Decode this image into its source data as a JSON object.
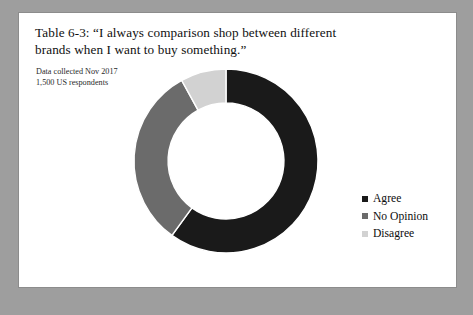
{
  "figure": {
    "title": "Table 6-3: “I always comparison shop between different brands when I want to buy something.”",
    "subtitle_line1": "Data collected Nov 2017",
    "subtitle_line2": "1,500 US respondents"
  },
  "colors": {
    "agree": "#1a1a1a",
    "no_opinion": "#6b6b6b",
    "disagree": "#d2d2d2",
    "page_background": "#ffffff",
    "backdrop": "#9e9e9e",
    "page_border": "#8c8c8c"
  },
  "legend": {
    "items": [
      {
        "label": "Agree",
        "color": "#1a1a1a"
      },
      {
        "label": "No Opinion",
        "color": "#6b6b6b"
      },
      {
        "label": "Disagree",
        "color": "#d2d2d2"
      }
    ]
  },
  "chart_data": {
    "type": "pie",
    "variant": "donut",
    "title": "Table 6-3: “I always comparison shop between different brands when I want to buy something.”",
    "subtitle": "Data collected Nov 2017 / 1,500 US respondents",
    "categories": [
      "Agree",
      "No Opinion",
      "Disagree"
    ],
    "values": [
      60,
      32,
      8
    ],
    "value_unit": "percent",
    "colors": [
      "#1a1a1a",
      "#6b6b6b",
      "#d2d2d2"
    ],
    "start_angle_deg": 0,
    "direction": "clockwise",
    "inner_radius_ratio": 0.63,
    "legend_position": "right",
    "grid": false,
    "data_labels_shown": false
  }
}
